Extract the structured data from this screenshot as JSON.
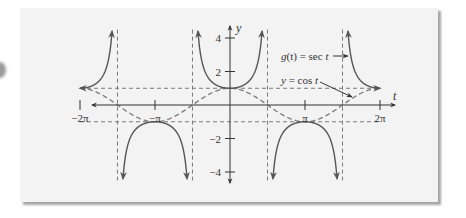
{
  "chart_data": {
    "type": "line",
    "title": "",
    "xlabel": "t",
    "ylabel": "y",
    "xlim": [
      -6.6,
      6.9
    ],
    "ylim": [
      -4.5,
      4.6
    ],
    "grid": false,
    "legend": "annotations",
    "x_ticks": [
      {
        "value": -6.2832,
        "label": "−2π"
      },
      {
        "value": -3.1416,
        "label": "−π"
      },
      {
        "value": 3.1416,
        "label": "π"
      },
      {
        "value": 6.2832,
        "label": "2π"
      }
    ],
    "y_ticks": [
      {
        "value": 4,
        "label": "4"
      },
      {
        "value": 2,
        "label": "2"
      },
      {
        "value": -2,
        "label": "−2"
      },
      {
        "value": -4,
        "label": "−4"
      }
    ],
    "series": [
      {
        "name": "g(t) = sec t",
        "style": "solid",
        "color": "#555555",
        "function": "sec",
        "domain": [
          -6.2832,
          6.2832
        ],
        "sample_points": [
          {
            "t": -6.2832,
            "y": 1
          },
          {
            "t": -5.5,
            "y": 1.41
          },
          {
            "t": -4.97,
            "y": 3.9
          },
          {
            "t": -4.45,
            "y": -3.9
          },
          {
            "t": -3.1416,
            "y": -1
          },
          {
            "t": -1.83,
            "y": -3.9
          },
          {
            "t": -1.31,
            "y": 3.9
          },
          {
            "t": 0,
            "y": 1
          },
          {
            "t": 1.31,
            "y": 3.9
          },
          {
            "t": 1.83,
            "y": -3.9
          },
          {
            "t": 3.1416,
            "y": -1
          },
          {
            "t": 4.45,
            "y": -3.9
          },
          {
            "t": 4.97,
            "y": 3.9
          },
          {
            "t": 5.5,
            "y": 1.41
          },
          {
            "t": 6.2832,
            "y": 1
          }
        ]
      },
      {
        "name": "y = cos t",
        "style": "dashed",
        "color": "#777777",
        "function": "cos",
        "domain": [
          -6.2832,
          6.2832
        ],
        "sample_points": [
          {
            "t": -6.2832,
            "y": 1
          },
          {
            "t": -4.7124,
            "y": 0
          },
          {
            "t": -3.1416,
            "y": -1
          },
          {
            "t": -1.5708,
            "y": 0
          },
          {
            "t": 0,
            "y": 1
          },
          {
            "t": 1.5708,
            "y": 0
          },
          {
            "t": 3.1416,
            "y": -1
          },
          {
            "t": 4.7124,
            "y": 0
          },
          {
            "t": 6.2832,
            "y": 1
          }
        ]
      }
    ],
    "reference_lines": {
      "horizontal_dashed": [
        1,
        -1
      ],
      "vertical_asymptotes": [
        -4.7124,
        -1.5708,
        1.5708,
        4.7124
      ]
    },
    "annotations": [
      {
        "text": "g(t) = sec t",
        "points_to": "sec curve near t = 3π/2 right branch"
      },
      {
        "text": "y = cos t",
        "points_to": "cos curve near t = 3π/2"
      }
    ]
  },
  "labels": {
    "y_axis": "y",
    "x_axis": "t",
    "sec_label_g": "g",
    "sec_label_rest": "(t) = sec ",
    "sec_label_t": "t",
    "cos_label_y": "y",
    "cos_label_rest": " = cos ",
    "cos_label_t": "t",
    "tick_neg2pi": "−2π",
    "tick_negpi": "−π",
    "tick_pi": "π",
    "tick_2pi": "2π",
    "tick_y4": "4",
    "tick_y2": "2",
    "tick_yneg2": "−2",
    "tick_yneg4": "−4"
  },
  "colors": {
    "panel": "#f3f3f3",
    "axis": "#333333",
    "sec_curve": "#555555",
    "dashed": "#7a7a7a"
  }
}
